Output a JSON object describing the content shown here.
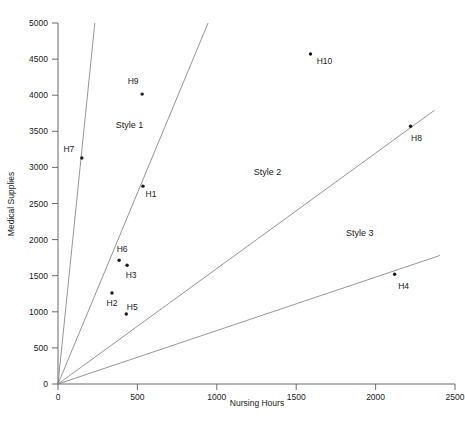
{
  "chart_data": {
    "type": "scatter",
    "title": "",
    "xlabel": "Nursing Hours",
    "ylabel": "Medical Supplies",
    "xlim": [
      0,
      2500
    ],
    "ylim": [
      0,
      5000
    ],
    "xticks": [
      0,
      500,
      1000,
      1500,
      2000,
      2500
    ],
    "yticks": [
      0,
      500,
      1000,
      1500,
      2000,
      2500,
      3000,
      3500,
      4000,
      4500,
      5000
    ],
    "grid": false,
    "legend": "none",
    "points": [
      {
        "label": "H7",
        "x": 150,
        "y": 3130,
        "label_dx": -13,
        "label_dy": -6
      },
      {
        "label": "H9",
        "x": 530,
        "y": 4015,
        "label_dx": -9,
        "label_dy": -10
      },
      {
        "label": "H1",
        "x": 535,
        "y": 2740,
        "label_dx": 8,
        "label_dy": 11
      },
      {
        "label": "H6",
        "x": 385,
        "y": 1715,
        "label_dx": 3,
        "label_dy": -8
      },
      {
        "label": "H3",
        "x": 435,
        "y": 1645,
        "label_dx": 4,
        "label_dy": 13
      },
      {
        "label": "H2",
        "x": 340,
        "y": 1260,
        "label_dx": 0,
        "label_dy": 13
      },
      {
        "label": "H5",
        "x": 430,
        "y": 970,
        "label_dx": 6,
        "label_dy": -4
      },
      {
        "label": "H10",
        "x": 1590,
        "y": 4570,
        "label_dx": 14,
        "label_dy": 10
      },
      {
        "label": "H8",
        "x": 2220,
        "y": 3570,
        "label_dx": 6,
        "label_dy": 15
      },
      {
        "label": "H4",
        "x": 2120,
        "y": 1520,
        "label_dx": 9,
        "label_dy": 15
      }
    ],
    "boundary_rays": [
      {
        "name": "style1-upper",
        "x_end": 232,
        "y_end": 5000
      },
      {
        "name": "style1-lower",
        "x_end": 945,
        "y_end": 5000
      },
      {
        "name": "style2-lower",
        "x_end": 2370,
        "y_end": 3790
      },
      {
        "name": "style3-lower",
        "x_end": 2405,
        "y_end": 1780
      }
    ],
    "regions": [
      {
        "label": "Style 1",
        "x": 450,
        "y": 3550
      },
      {
        "label": "Style 2",
        "x": 1320,
        "y": 2900
      },
      {
        "label": "Style 3",
        "x": 1900,
        "y": 2050
      }
    ]
  }
}
